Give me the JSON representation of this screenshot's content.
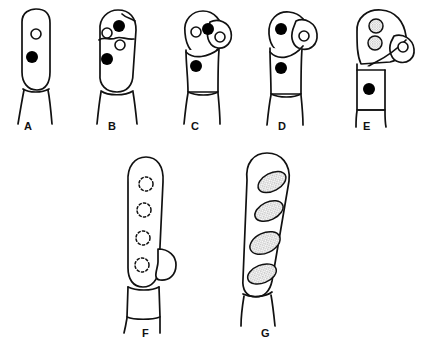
{
  "diagram": {
    "type": "line-drawing",
    "style": {
      "stroke_color": "#111111",
      "fill_color": "#ffffff",
      "nucleus_solid_color": "#000000",
      "nucleus_hollow_color": "#ffffff",
      "spore_stipple_color": "#8a8a8a",
      "background": "#ffffff"
    },
    "panels": [
      {
        "id": "A",
        "label": "A",
        "label_x": 28,
        "label_y": 126,
        "description": "Young unbranched club-shaped basidium with one hollow nucleus above one solid nucleus, borne on a basal stalk cell",
        "nuclei": [
          {
            "kind": "hollow",
            "cx": 36,
            "cy": 34,
            "r": 5
          },
          {
            "kind": "solid",
            "cx": 32,
            "cy": 57,
            "r": 6
          }
        ],
        "spores": [],
        "has_lateral_bud": false,
        "has_septum": false
      },
      {
        "id": "B",
        "label": "B",
        "label_x": 112,
        "label_y": 126,
        "description": "Swollen basidium with one solid nucleus and two hollow nuclei at the apex, a partial cross wall, and a solid nucleus beneath",
        "nuclei": [
          {
            "kind": "solid",
            "cx": 119,
            "cy": 26,
            "r": 6
          },
          {
            "kind": "hollow",
            "cx": 107,
            "cy": 33,
            "r": 5
          },
          {
            "kind": "hollow",
            "cx": 120,
            "cy": 45,
            "r": 5
          },
          {
            "kind": "solid",
            "cx": 107,
            "cy": 59,
            "r": 6
          }
        ],
        "spores": [],
        "has_lateral_bud": false,
        "has_septum": true
      },
      {
        "id": "C",
        "label": "C",
        "label_x": 195,
        "label_y": 126,
        "description": "Basidium with tilted apical head bearing a hollow and a solid nucleus, an emerging lateral lobe containing a hollow nucleus, and a solid nucleus in the cell below the septum",
        "nuclei": [
          {
            "kind": "hollow",
            "cx": 196,
            "cy": 32,
            "r": 5
          },
          {
            "kind": "solid",
            "cx": 208,
            "cy": 29,
            "r": 6
          },
          {
            "kind": "hollow",
            "cx": 220,
            "cy": 37,
            "r": 5
          },
          {
            "kind": "solid",
            "cx": 196,
            "cy": 66,
            "r": 6
          }
        ],
        "spores": [],
        "has_lateral_bud": true,
        "has_septum": true
      },
      {
        "id": "D",
        "label": "D",
        "label_x": 282,
        "label_y": 126,
        "description": "Basidium with the apex bent over to the right, one solid nucleus in the bend, a rounded lateral lobe enclosing a hollow nucleus, and a solid nucleus below the curved septum",
        "nuclei": [
          {
            "kind": "solid",
            "cx": 281,
            "cy": 29,
            "r": 6
          },
          {
            "kind": "hollow",
            "cx": 304,
            "cy": 36,
            "r": 5
          },
          {
            "kind": "solid",
            "cx": 281,
            "cy": 68,
            "r": 6
          }
        ],
        "spores": [],
        "has_lateral_bud": true,
        "has_septum": true
      },
      {
        "id": "E",
        "label": "E",
        "label_x": 367,
        "label_y": 126,
        "description": "Hook-shaped apex holding two stippled maturing spores, a small lateral lobe with a hollow nucleus, and a boxed segment below containing a solid nucleus",
        "nuclei": [
          {
            "kind": "hollow",
            "cx": 403,
            "cy": 47,
            "r": 5
          },
          {
            "kind": "solid",
            "cx": 369,
            "cy": 89,
            "r": 6
          }
        ],
        "spores": [
          {
            "kind": "stippled-circle",
            "cx": 376,
            "cy": 26,
            "r": 7
          },
          {
            "kind": "stippled-circle",
            "cx": 375,
            "cy": 43,
            "r": 7
          }
        ],
        "has_lateral_bud": true,
        "has_septum": true
      },
      {
        "id": "F",
        "label": "F",
        "label_x": 146,
        "label_y": 333,
        "description": "Long cylindrical ascus outlined with four evenly spaced dashed circles marking immature spores and a small lateral bud near the base",
        "nuclei": [],
        "spores": [
          {
            "kind": "dashed-circle",
            "cx": 146,
            "cy": 184,
            "r": 7
          },
          {
            "kind": "dashed-circle",
            "cx": 144,
            "cy": 210,
            "r": 7
          },
          {
            "kind": "dashed-circle",
            "cx": 143,
            "cy": 238,
            "r": 7
          },
          {
            "kind": "dashed-circle",
            "cx": 142,
            "cy": 265,
            "r": 7
          }
        ],
        "has_lateral_bud": true,
        "has_septum": true
      },
      {
        "id": "G",
        "label": "G",
        "label_x": 265,
        "label_y": 333,
        "description": "Mature club-shaped ascus containing four large stippled ellipsoid spores arranged obliquely in a row above the basal stalk",
        "nuclei": [],
        "spores": [
          {
            "kind": "stippled-ellipse",
            "cx": 272,
            "cy": 182,
            "rx": 15,
            "ry": 9,
            "rotation": -28
          },
          {
            "kind": "stippled-ellipse",
            "cx": 269,
            "cy": 211,
            "rx": 15,
            "ry": 9,
            "rotation": -25
          },
          {
            "kind": "stippled-ellipse",
            "cx": 265,
            "cy": 243,
            "rx": 16,
            "ry": 10,
            "rotation": -25
          },
          {
            "kind": "stippled-ellipse",
            "cx": 262,
            "cy": 274,
            "rx": 15,
            "ry": 9,
            "rotation": -22
          }
        ],
        "has_lateral_bud": false,
        "has_septum": true
      }
    ]
  }
}
